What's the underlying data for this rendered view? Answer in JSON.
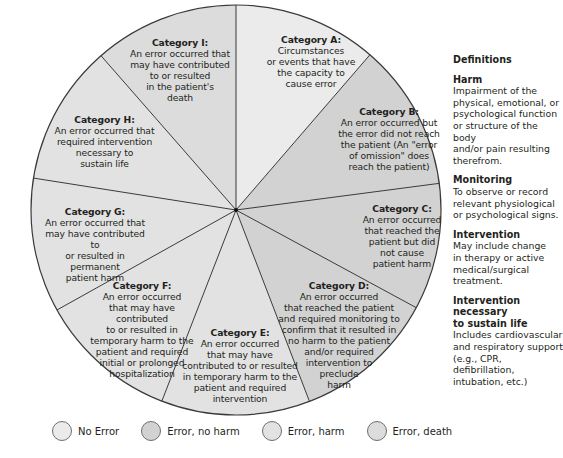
{
  "diagram": {
    "type": "segmented-wheel",
    "center": [
      236,
      210
    ],
    "radius": 205,
    "segments": [
      {
        "id": "A",
        "category": "Category A:",
        "description": "Circumstances\nor events that have\nthe capacity to\ncause error",
        "group": "no_error",
        "color": "#ebebeb",
        "start_point": [
          236,
          10
        ],
        "end_point": [
          368,
          57
        ]
      },
      {
        "id": "B",
        "category": "Category B:",
        "description": "An error occurred but\nthe error did not reach\nthe patient (An \"error\nof omission\" does\nreach the patient)",
        "group": "error_no_harm",
        "color": "#d2d2d2",
        "start_point": [
          368,
          57
        ],
        "end_point": [
          442,
          183
        ]
      },
      {
        "id": "C",
        "category": "Category C:",
        "description": "An error occurred\nthat reached the\npatient but did\nnot cause\npatient harm",
        "group": "error_no_harm",
        "color": "#d2d2d2",
        "start_point": [
          442,
          183
        ],
        "end_point": [
          415,
          307
        ]
      },
      {
        "id": "D",
        "category": "Category D:",
        "description": "An error occurred\nthat reached the patient\nand required monitoring to\nconfirm that it resulted in\nno harm to the patient\nand/or required\nintervention to\npreclude\nharm",
        "group": "error_no_harm",
        "color": "#d2d2d2",
        "start_point": [
          415,
          307
        ],
        "end_point": [
          307,
          395
        ]
      },
      {
        "id": "E",
        "category": "Category E:",
        "description": "An error occurred\nthat may have\ncontributed to or resulted\nin temporary harm to the\npatient and required\nintervention",
        "group": "error_harm",
        "color": "#e2e2e2",
        "start_point": [
          307,
          395
        ],
        "end_point": [
          165,
          393
        ]
      },
      {
        "id": "F",
        "category": "Category F:",
        "description": "An error occurred\nthat may have contributed\nto or resulted in\ntemporary harm to the\npatient and required\ninitial or prolonged\nhospitalization",
        "group": "error_harm",
        "color": "#e2e2e2",
        "start_point": [
          165,
          393
        ],
        "end_point": [
          57,
          310
        ]
      },
      {
        "id": "G",
        "category": "Category G:",
        "description": "An error occurred that\nmay have contributed to\nor resulted in permanent\npatient harm",
        "group": "error_harm",
        "color": "#e2e2e2",
        "start_point": [
          57,
          310
        ],
        "end_point": [
          33,
          178
        ]
      },
      {
        "id": "H",
        "category": "Category H:",
        "description": "An error occurred that\nrequired intervention\nnecessary to\nsustain life",
        "group": "error_harm",
        "color": "#e2e2e2",
        "start_point": [
          33,
          178
        ],
        "end_point": [
          103,
          58
        ]
      },
      {
        "id": "I",
        "category": "Category I:",
        "description": "An error occurred that\nmay have contributed\nto or resulted\nin the patient's\ndeath",
        "group": "error_death",
        "color": "#dcdcdc",
        "start_point": [
          103,
          58
        ],
        "end_point": [
          236,
          10
        ]
      }
    ],
    "stroke_color": "#3a3a3a"
  },
  "definitions": {
    "title": "Definitions",
    "items": [
      {
        "term": "Harm",
        "definition": "Impairment of the\nphysical, emotional, or\npsychological function\nor structure of the body\nand/or pain resulting\ntherefrom."
      },
      {
        "term": "Monitoring",
        "definition": "To observe or record\nrelevant physiological\nor psychological signs."
      },
      {
        "term": "Intervention",
        "definition": "May include change\nin therapy or active\nmedical/surgical\ntreatment."
      },
      {
        "term": "Intervention necessary\nto sustain life",
        "definition": "Includes cardiovascular\nand respiratory support\n(e.g., CPR, defibrillation,\nintubation, etc.)"
      }
    ]
  },
  "legend": {
    "items": [
      {
        "label": "No Error",
        "color": "#ebebeb"
      },
      {
        "label": "Error, no harm",
        "color": "#d2d2d2"
      },
      {
        "label": "Error, harm",
        "color": "#e2e2e2"
      },
      {
        "label": "Error, death",
        "color": "#dcdcdc"
      }
    ]
  }
}
